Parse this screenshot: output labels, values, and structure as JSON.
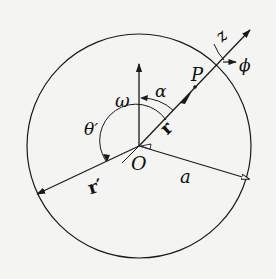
{
  "diagram": {
    "type": "geometry-figure",
    "labels": {
      "origin": "O",
      "point": "P",
      "omega": "ω",
      "alpha": "α",
      "theta_prime": "θ′",
      "r": "r",
      "r_prime": "r′",
      "radius": "a",
      "z": "z",
      "phi": "ϕ"
    },
    "colors": {
      "stroke": "#1a1a1a",
      "background": "#f4f4f2"
    }
  }
}
